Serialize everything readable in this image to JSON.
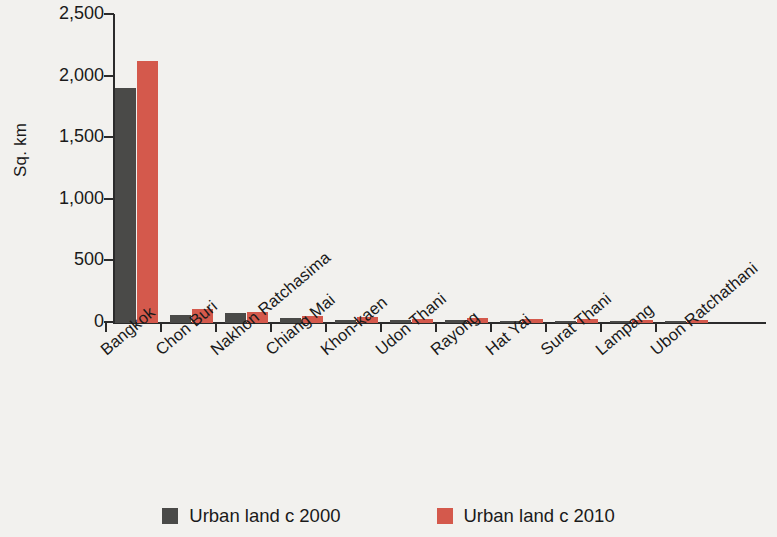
{
  "chart_data": {
    "type": "bar",
    "title": "",
    "subtitle": "",
    "xlabel": "",
    "ylabel": "Sq. km",
    "ylim": [
      0,
      2500
    ],
    "yticks": [
      0,
      500,
      1000,
      1500,
      2000,
      2500
    ],
    "ytick_labels": [
      "0",
      "500",
      "1,000",
      "1,500",
      "2,000",
      "2,500"
    ],
    "grid": false,
    "legend_position": "bottom",
    "orientation": "vertical",
    "grouping": "grouped",
    "categories": [
      "Bangkok",
      "Chon Buri",
      "Nakhon Ratchasima",
      "Chiang Mai",
      "Khon-kaen",
      "Udon Thani",
      "Rayong",
      "Hat Yai",
      "Surat Thani",
      "Lampang",
      "Ubon Ratchathani"
    ],
    "series": [
      {
        "name": "Urban land c 2000",
        "color": "#4a4a48",
        "values": [
          1905,
          65,
          80,
          40,
          25,
          25,
          22,
          20,
          10,
          12,
          12
        ]
      },
      {
        "name": "Urban land c 2010",
        "color": "#d4594c",
        "values": [
          2130,
          115,
          90,
          55,
          45,
          35,
          38,
          35,
          32,
          22,
          28
        ]
      }
    ]
  },
  "legend": {
    "items": [
      {
        "label": "Urban land c 2000",
        "color": "#4a4a48"
      },
      {
        "label": "Urban land c 2010",
        "color": "#d4594c"
      }
    ]
  },
  "colors": {
    "series_2000": "#4a4a48",
    "series_2010": "#d4594c",
    "axis": "#2b2b2b",
    "background": "#f2f1ee",
    "text": "#1a1a1a"
  }
}
